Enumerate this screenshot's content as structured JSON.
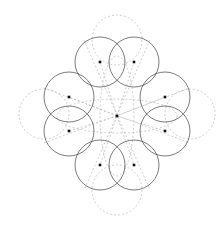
{
  "figure": {
    "canvas": {
      "width": 222,
      "height": 226,
      "background": "#ffffff"
    },
    "style": {
      "solid_stroke": "#444444",
      "solid_stroke_width": 0.7,
      "dashed_stroke": "#b9b9b9",
      "dashed_stroke_width": 0.7,
      "dash_pattern": "2 2",
      "center_dot_color": "#111111",
      "center_dot_size": 2.6
    },
    "center": {
      "label": "center-point",
      "x": 117,
      "y": 116
    },
    "radius": 25,
    "solid_circles": [
      {
        "label": "circle-top-left",
        "cx": 100,
        "cy": 62,
        "r": 25
      },
      {
        "label": "circle-top-right",
        "cx": 134,
        "cy": 62,
        "r": 25
      },
      {
        "label": "circle-left-upper",
        "cx": 69,
        "cy": 97,
        "r": 25
      },
      {
        "label": "circle-right-upper",
        "cx": 165,
        "cy": 97,
        "r": 25
      },
      {
        "label": "circle-left-lower",
        "cx": 69,
        "cy": 131,
        "r": 25
      },
      {
        "label": "circle-right-lower",
        "cx": 165,
        "cy": 131,
        "r": 25
      },
      {
        "label": "circle-bottom-left",
        "cx": 100,
        "cy": 165,
        "r": 25
      },
      {
        "label": "circle-bottom-right",
        "cx": 134,
        "cy": 165,
        "r": 25
      }
    ],
    "dashed_circles": [
      {
        "label": "dashed-circle-top",
        "cx": 117,
        "cy": 40,
        "r": 25
      },
      {
        "label": "dashed-circle-bottom",
        "cx": 117,
        "cy": 190,
        "r": 25
      },
      {
        "label": "dashed-circle-left",
        "cx": 44,
        "cy": 114,
        "r": 25
      },
      {
        "label": "dashed-circle-right",
        "cx": 190,
        "cy": 114,
        "r": 25
      }
    ],
    "dashed_ellipses": [
      {
        "label": "dashed-ellipse-horizontal",
        "cx": 117,
        "cy": 116,
        "rx": 60,
        "ry": 17
      },
      {
        "label": "dashed-ellipse-vertical",
        "cx": 117,
        "cy": 116,
        "rx": 17,
        "ry": 60
      }
    ],
    "dashed_rays": [
      {
        "label": "ray-to-top-left",
        "x1": 117,
        "y1": 116,
        "x2": 100,
        "y2": 62
      },
      {
        "label": "ray-to-top-right",
        "x1": 117,
        "y1": 116,
        "x2": 134,
        "y2": 62
      },
      {
        "label": "ray-to-left-upper",
        "x1": 117,
        "y1": 116,
        "x2": 69,
        "y2": 97
      },
      {
        "label": "ray-to-right-upper",
        "x1": 117,
        "y1": 116,
        "x2": 165,
        "y2": 97
      },
      {
        "label": "ray-to-left-lower",
        "x1": 117,
        "y1": 116,
        "x2": 69,
        "y2": 131
      },
      {
        "label": "ray-to-right-lower",
        "x1": 117,
        "y1": 116,
        "x2": 165,
        "y2": 131
      },
      {
        "label": "ray-to-bottom-left",
        "x1": 117,
        "y1": 116,
        "x2": 100,
        "y2": 165
      },
      {
        "label": "ray-to-bottom-right",
        "x1": 117,
        "y1": 116,
        "x2": 134,
        "y2": 165
      }
    ],
    "dashed_long_lines": [
      {
        "label": "diagonal-top-left-to-bottom-right",
        "x1": 84,
        "y1": 40,
        "x2": 150,
        "y2": 190
      },
      {
        "label": "diagonal-top-right-to-bottom-left",
        "x1": 150,
        "y1": 40,
        "x2": 84,
        "y2": 190
      },
      {
        "label": "diagonal-left-upper-to-right-lower",
        "x1": 44,
        "y1": 88,
        "x2": 190,
        "y2": 143
      },
      {
        "label": "diagonal-left-lower-to-right-upper",
        "x1": 44,
        "y1": 143,
        "x2": 190,
        "y2": 88
      }
    ],
    "center_dots": [
      {
        "label": "dot-center",
        "x": 117,
        "y": 116
      },
      {
        "label": "dot-top-left",
        "x": 100,
        "y": 62
      },
      {
        "label": "dot-top-right",
        "x": 134,
        "y": 62
      },
      {
        "label": "dot-left-upper",
        "x": 69,
        "y": 97
      },
      {
        "label": "dot-right-upper",
        "x": 165,
        "y": 97
      },
      {
        "label": "dot-left-lower",
        "x": 69,
        "y": 131
      },
      {
        "label": "dot-right-lower",
        "x": 165,
        "y": 131
      },
      {
        "label": "dot-bottom-left",
        "x": 100,
        "y": 165
      },
      {
        "label": "dot-bottom-right",
        "x": 134,
        "y": 165
      }
    ]
  }
}
